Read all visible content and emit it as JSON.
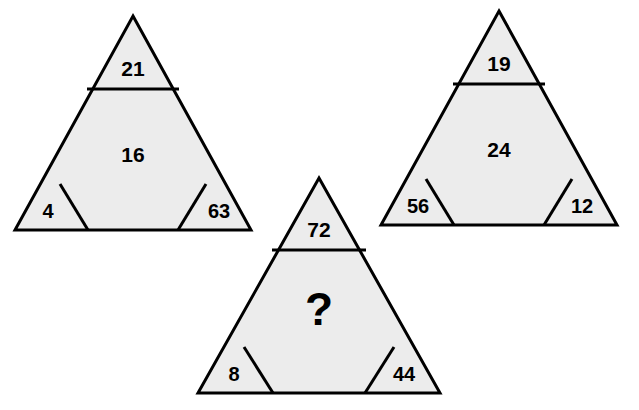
{
  "diagram": {
    "type": "triangle-number-puzzle",
    "background_color": "#ffffff",
    "shape_fill": "#ececec",
    "shape_stroke": "#000000",
    "triangles": [
      {
        "id": "triangle-left",
        "top": "21",
        "middle": "16",
        "bottom_left": "4",
        "bottom_right": "63"
      },
      {
        "id": "triangle-right",
        "top": "19",
        "middle": "24",
        "bottom_left": "56",
        "bottom_right": "12"
      },
      {
        "id": "triangle-bottom",
        "top": "72",
        "middle": "?",
        "bottom_left": "8",
        "bottom_right": "44"
      }
    ]
  }
}
